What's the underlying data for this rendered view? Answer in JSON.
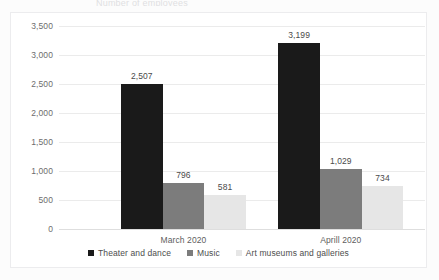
{
  "page": {
    "background_color": "#fcfcfc",
    "title_remnant": "Number of employees"
  },
  "chart_frame": {
    "border_color": "#ececee",
    "plot_background": "#ffffff"
  },
  "legend": {
    "position": "bottom-center",
    "entries": [
      {
        "label": "Theater and dance",
        "color": "#1a1a1a"
      },
      {
        "label": "Music",
        "color": "#7c7c7c"
      },
      {
        "label": "Art museums and galleries",
        "color": "#e6e6e6"
      }
    ]
  },
  "axes": {
    "y_ticks": [
      "3,500",
      "3,000",
      "2,500",
      "2,000",
      "1,500",
      "1,000",
      "500",
      "0"
    ],
    "y_tick_values": [
      3500,
      3000,
      2500,
      2000,
      1500,
      1000,
      500,
      0
    ],
    "x_categories": [
      "March 2020",
      "Aprill 2020"
    ]
  },
  "chart_data": {
    "type": "bar",
    "title": "",
    "xlabel": "",
    "ylabel": "",
    "ylim": [
      0,
      3500
    ],
    "ytick_step": 500,
    "grid": true,
    "legend_position": "bottom",
    "categories": [
      "March 2020",
      "Aprill 2020"
    ],
    "series": [
      {
        "name": "Theater and dance",
        "color": "#1a1a1a",
        "values": [
          2507,
          3199
        ],
        "labels": [
          "2,507",
          "3,199"
        ]
      },
      {
        "name": "Music",
        "color": "#7c7c7c",
        "values": [
          796,
          1029
        ],
        "labels": [
          "796",
          "1,029"
        ]
      },
      {
        "name": "Art museums and galleries",
        "color": "#e6e6e6",
        "values": [
          581,
          734
        ],
        "labels": [
          "581",
          "734"
        ]
      }
    ]
  }
}
